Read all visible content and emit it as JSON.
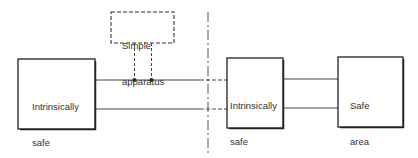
{
  "diagram": {
    "nodes": [
      {
        "id": "is_apparatus",
        "lines": [
          "Intrinsically",
          "safe",
          "apparatus"
        ]
      },
      {
        "id": "simple_apparatus",
        "lines": [
          "Simple",
          "apparatus"
        ],
        "style": "dashed"
      },
      {
        "id": "is_interface",
        "lines": [
          "Intrinsically",
          "safe",
          "interface"
        ]
      },
      {
        "id": "safe_area_apparatus",
        "lines": [
          "Safe",
          "area",
          "apparatus"
        ]
      }
    ],
    "edges": [
      {
        "from": "is_apparatus",
        "to": "is_interface",
        "count": 2,
        "note": "two conductors; dashed where crossing the boundary"
      },
      {
        "from": "simple_apparatus",
        "to": "is_apparatus-is_interface wires",
        "count": 2,
        "style": "dashed",
        "note": "taps onto both conductors with junction dots"
      },
      {
        "from": "is_interface",
        "to": "safe_area_apparatus",
        "count": 2
      }
    ],
    "boundary": {
      "style": "dash-dot",
      "orientation": "vertical",
      "note": "hazardous / safe area boundary"
    }
  }
}
